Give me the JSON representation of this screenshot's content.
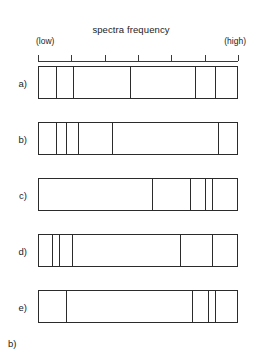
{
  "axis": {
    "title": "spectra frequency",
    "low_label": "(low)",
    "high_label": "(high)",
    "tick_count": 7,
    "tick_positions_pct": [
      0,
      16.7,
      33.3,
      50,
      66.7,
      83.3,
      100
    ],
    "line_color": "#3a3a3a"
  },
  "caption": "b)",
  "chart_data": {
    "type": "diagram",
    "title": "spectra frequency",
    "xlabel": "spectra frequency",
    "xlim": [
      0,
      100
    ],
    "x_low_label": "(low)",
    "x_high_label": "(high)",
    "grid": false,
    "legend": "none",
    "rows": [
      {
        "label": "a)",
        "marker_positions_pct": [
          0,
          9,
          17.5,
          46,
          78.5,
          88.5,
          100
        ]
      },
      {
        "label": "b)",
        "marker_positions_pct": [
          0,
          9,
          14,
          20,
          37,
          90,
          100
        ]
      },
      {
        "label": "c)",
        "marker_positions_pct": [
          0,
          57,
          76,
          83.5,
          87,
          100
        ]
      },
      {
        "label": "d)",
        "marker_positions_pct": [
          0,
          7,
          10.5,
          17,
          71,
          87,
          100
        ]
      },
      {
        "label": "e)",
        "marker_positions_pct": [
          0,
          14,
          77,
          85,
          88.5,
          100
        ]
      }
    ]
  }
}
